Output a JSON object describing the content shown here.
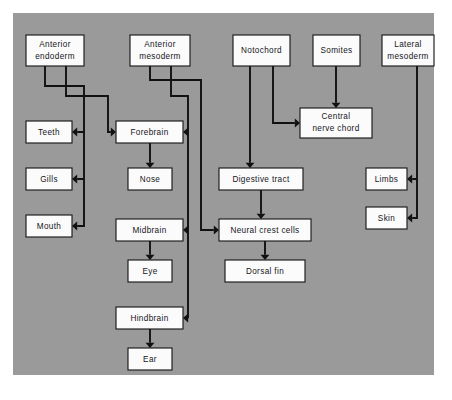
{
  "figure": {
    "panel_color": "#9a9a9a",
    "box_fill": "#fbfbfb",
    "line_color": "#111111",
    "background": "#ffffff"
  },
  "nodes": [
    {
      "id": "anterior-endoderm",
      "label_line1": "Anterior",
      "label_line2": "endoderm",
      "x": 26,
      "y": 35,
      "w": 58,
      "h": 31
    },
    {
      "id": "anterior-mesoderm",
      "label_line1": "Anterior",
      "label_line2": "mesoderm",
      "x": 130,
      "y": 35,
      "w": 60,
      "h": 31
    },
    {
      "id": "notochord",
      "label_line1": "Notochord",
      "label_line2": "",
      "x": 233,
      "y": 35,
      "w": 57,
      "h": 31
    },
    {
      "id": "somites",
      "label_line1": "Somites",
      "label_line2": "",
      "x": 313,
      "y": 35,
      "w": 47,
      "h": 31
    },
    {
      "id": "lateral-mesoderm",
      "label_line1": "Lateral",
      "label_line2": "mesoderm",
      "x": 382,
      "y": 35,
      "w": 52,
      "h": 31
    },
    {
      "id": "teeth",
      "label_line1": "Teeth",
      "label_line2": "",
      "x": 26,
      "y": 121,
      "w": 46,
      "h": 22
    },
    {
      "id": "gills",
      "label_line1": "Gills",
      "label_line2": "",
      "x": 26,
      "y": 168,
      "w": 46,
      "h": 22
    },
    {
      "id": "mouth",
      "label_line1": "Mouth",
      "label_line2": "",
      "x": 26,
      "y": 215,
      "w": 46,
      "h": 22
    },
    {
      "id": "forebrain",
      "label_line1": "Forebrain",
      "label_line2": "",
      "x": 116,
      "y": 121,
      "w": 67,
      "h": 22
    },
    {
      "id": "nose",
      "label_line1": "Nose",
      "label_line2": "",
      "x": 128,
      "y": 168,
      "w": 44,
      "h": 22
    },
    {
      "id": "midbrain",
      "label_line1": "Midbrain",
      "label_line2": "",
      "x": 116,
      "y": 219,
      "w": 67,
      "h": 22
    },
    {
      "id": "eye",
      "label_line1": "Eye",
      "label_line2": "",
      "x": 128,
      "y": 260,
      "w": 44,
      "h": 22
    },
    {
      "id": "hindbrain",
      "label_line1": "Hindbrain",
      "label_line2": "",
      "x": 116,
      "y": 307,
      "w": 67,
      "h": 22
    },
    {
      "id": "ear",
      "label_line1": "Ear",
      "label_line2": "",
      "x": 128,
      "y": 348,
      "w": 44,
      "h": 22
    },
    {
      "id": "central-nerve-chord",
      "label_line1": "Central",
      "label_line2": "nerve chord",
      "x": 300,
      "y": 108,
      "w": 72,
      "h": 30
    },
    {
      "id": "digestive-tract",
      "label_line1": "Digestive tract",
      "label_line2": "",
      "x": 219,
      "y": 168,
      "w": 84,
      "h": 22
    },
    {
      "id": "neural-crest-cells",
      "label_line1": "Neural crest cells",
      "label_line2": "",
      "x": 219,
      "y": 219,
      "w": 92,
      "h": 22
    },
    {
      "id": "dorsal-fin",
      "label_line1": "Dorsal fin",
      "label_line2": "",
      "x": 225,
      "y": 260,
      "w": 80,
      "h": 22
    },
    {
      "id": "limbs",
      "label_line1": "Limbs",
      "label_line2": "",
      "x": 366,
      "y": 168,
      "w": 41,
      "h": 22
    },
    {
      "id": "skin",
      "label_line1": "Skin",
      "label_line2": "",
      "x": 366,
      "y": 207,
      "w": 41,
      "h": 22
    }
  ],
  "connections": [
    {
      "id": "endoderm-to-teeth",
      "from": "anterior-endoderm",
      "to": "teeth"
    },
    {
      "id": "endoderm-to-gills",
      "from": "anterior-endoderm",
      "to": "gills"
    },
    {
      "id": "endoderm-to-mouth",
      "from": "anterior-endoderm",
      "to": "mouth"
    },
    {
      "id": "endoderm-to-forebrain",
      "from": "anterior-endoderm",
      "to": "forebrain"
    },
    {
      "id": "mesoderm-to-forebrain",
      "from": "anterior-mesoderm",
      "to": "forebrain"
    },
    {
      "id": "mesoderm-to-midbrain",
      "from": "anterior-mesoderm",
      "to": "midbrain"
    },
    {
      "id": "mesoderm-to-hindbrain",
      "from": "anterior-mesoderm",
      "to": "hindbrain"
    },
    {
      "id": "mesoderm-to-neural-crest",
      "from": "anterior-mesoderm",
      "to": "neural-crest-cells"
    },
    {
      "id": "forebrain-to-nose",
      "from": "forebrain",
      "to": "nose"
    },
    {
      "id": "midbrain-to-eye",
      "from": "midbrain",
      "to": "eye"
    },
    {
      "id": "hindbrain-to-ear",
      "from": "hindbrain",
      "to": "ear"
    },
    {
      "id": "notochord-to-digestive",
      "from": "notochord",
      "to": "digestive-tract"
    },
    {
      "id": "notochord-to-nerve-chord",
      "from": "notochord",
      "to": "central-nerve-chord"
    },
    {
      "id": "somites-to-nerve-chord",
      "from": "somites",
      "to": "central-nerve-chord"
    },
    {
      "id": "digestive-to-neural-crest",
      "from": "digestive-tract",
      "to": "neural-crest-cells"
    },
    {
      "id": "neural-crest-to-dorsal-fin",
      "from": "neural-crest-cells",
      "to": "dorsal-fin"
    },
    {
      "id": "lateral-to-limbs",
      "from": "lateral-mesoderm",
      "to": "limbs"
    },
    {
      "id": "lateral-to-skin",
      "from": "lateral-mesoderm",
      "to": "skin"
    }
  ]
}
